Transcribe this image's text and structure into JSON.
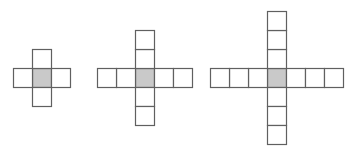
{
  "figure": {
    "background_color": "#ffffff",
    "cell_fill_color": "#ffffff",
    "cell_shaded_color": "#c9c9c9",
    "cell_stroke_color": "#606060",
    "cell_stroke_width": 1.2,
    "cell_size": 19,
    "center_y": 78,
    "shapes": [
      {
        "name": "cross-1",
        "label": "Figure 1",
        "arm_length": 1,
        "total_cells": 5,
        "width_cells": 3,
        "height_cells": 3,
        "center_x": 42,
        "center_y": 78
      },
      {
        "name": "cross-2",
        "label": "Figure 2",
        "arm_length": 2,
        "total_cells": 9,
        "width_cells": 5,
        "height_cells": 5,
        "center_x": 145,
        "center_y": 78
      },
      {
        "name": "cross-3",
        "label": "Figure 3",
        "arm_length": 3,
        "total_cells": 13,
        "width_cells": 7,
        "height_cells": 7,
        "center_x": 277,
        "center_y": 78
      }
    ]
  }
}
